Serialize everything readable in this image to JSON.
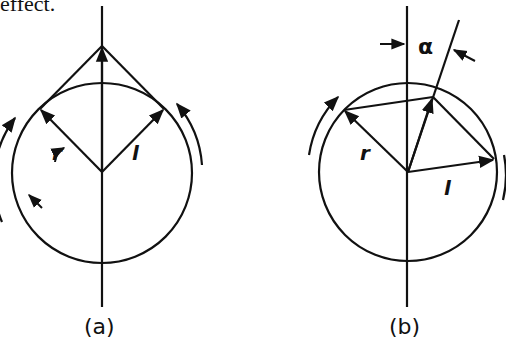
{
  "header": {
    "text": "effect."
  },
  "colors": {
    "ink": "#111111",
    "background": "#ffffff"
  },
  "panels": [
    {
      "id": "a",
      "caption": "(a)",
      "labels": {
        "r": "r",
        "l": "l"
      },
      "circle": {
        "cx": 102,
        "cy": 173,
        "r": 90
      }
    },
    {
      "id": "b",
      "caption": "(b)",
      "labels": {
        "r": "r",
        "l": "l",
        "alpha": "α"
      },
      "circle": {
        "cx": 408,
        "cy": 172,
        "r": 89
      }
    }
  ]
}
